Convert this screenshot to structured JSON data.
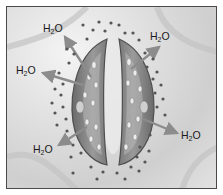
{
  "diagram": {
    "molecule_label": "H2O",
    "labels": [
      {
        "id": "top-left",
        "base": "H",
        "sub": "2",
        "tail": "O",
        "x": 36,
        "y": 16
      },
      {
        "id": "top-right",
        "base": "H",
        "sub": "2",
        "tail": "O",
        "x": 143,
        "y": 24
      },
      {
        "id": "left",
        "base": "H",
        "sub": "2",
        "tail": "O",
        "x": 9,
        "y": 58
      },
      {
        "id": "right",
        "base": "H",
        "sub": "2",
        "tail": "O",
        "x": 174,
        "y": 123
      },
      {
        "id": "bottom-left",
        "base": "H",
        "sub": "2",
        "tail": "O",
        "x": 26,
        "y": 137
      }
    ],
    "colors": {
      "border": "#4a4a4a",
      "background": "#d8d8d8",
      "guard_cell": "#8a8a8a",
      "guard_cell_dark": "#5e5e5e",
      "chloroplast": "#e8e8e8",
      "dot": "#555555",
      "arrow": "#8c8c8c",
      "text": "#1a1a1a"
    }
  }
}
